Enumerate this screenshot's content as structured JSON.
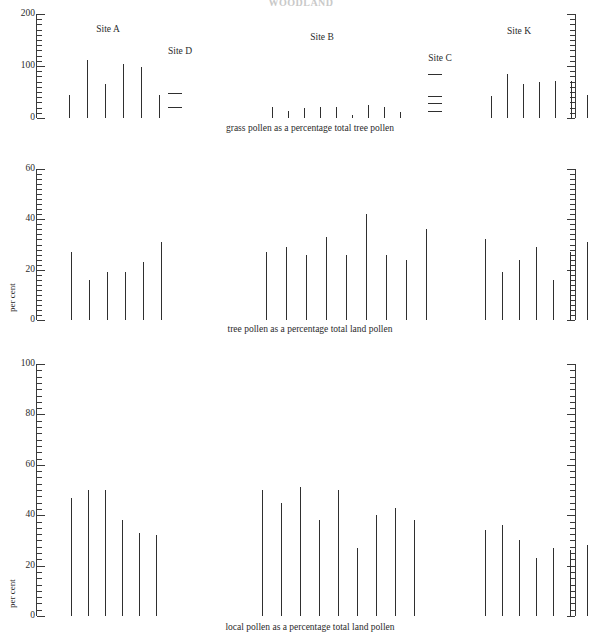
{
  "figure": {
    "top_title": "WOODLAND",
    "ylabel_panel2": "per cent",
    "ylabel_panel3": "per cent"
  },
  "site_labels": {
    "a": "Site A",
    "d": "Site D",
    "b": "Site B",
    "c": "Site C",
    "k": "Site K"
  },
  "captions": {
    "panel1": "grass pollen as a percentage total tree pollen",
    "panel2": "tree pollen as a percentage total land pollen",
    "panel3": "local pollen as a percentage total land pollen"
  },
  "chart_data": [
    {
      "type": "bar",
      "title": "grass pollen as a percentage total tree pollen",
      "xlabel": "",
      "ylabel": "",
      "ylim": [
        0,
        200
      ],
      "ticks_major": [
        0,
        100,
        200
      ],
      "tick_interval_minor": 10,
      "grid": false,
      "axes": "ruler style, mirrored left and right",
      "series": [
        {
          "name": "Site A",
          "values": [
            44,
            112,
            66,
            103,
            99,
            45
          ]
        },
        {
          "name": "Site D",
          "values": [
            7,
            3
          ]
        },
        {
          "name": "Site B",
          "values": [
            22,
            14,
            20,
            21,
            22,
            5,
            25,
            22,
            12
          ]
        },
        {
          "name": "Site C",
          "values": [
            12,
            6,
            4,
            2
          ]
        },
        {
          "name": "Site K",
          "values": [
            43,
            85,
            65,
            70,
            72,
            71,
            44
          ]
        }
      ]
    },
    {
      "type": "bar",
      "title": "tree pollen as a percentage total land pollen",
      "xlabel": "",
      "ylabel": "per cent",
      "ylim": [
        0,
        60
      ],
      "ticks_major": [
        0,
        20,
        40,
        60
      ],
      "tick_interval_minor": 2,
      "grid": false,
      "axes": "ruler style, mirrored left and right",
      "series": [
        {
          "name": "Site A",
          "values": [
            27,
            16,
            19,
            19,
            23,
            31
          ]
        },
        {
          "name": "Site B",
          "values": [
            27,
            29,
            26,
            33,
            26,
            42,
            26,
            24,
            36
          ]
        },
        {
          "name": "Site K",
          "values": [
            32,
            19,
            24,
            29,
            16,
            27,
            31
          ]
        }
      ]
    },
    {
      "type": "bar",
      "title": "local pollen as a percentage total land pollen",
      "xlabel": "",
      "ylabel": "per cent",
      "ylim": [
        0,
        100
      ],
      "ticks_major": [
        0,
        20,
        40,
        60,
        80,
        100
      ],
      "tick_interval_minor": 2.5,
      "grid": false,
      "axes": "ruler style, mirrored left and right",
      "series": [
        {
          "name": "Site A",
          "values": [
            47,
            50,
            50,
            38,
            33,
            32
          ]
        },
        {
          "name": "Site B",
          "values": [
            50,
            45,
            51,
            38,
            50,
            27,
            40,
            43,
            38
          ]
        },
        {
          "name": "Site K",
          "values": [
            34,
            36,
            30,
            23,
            27,
            26,
            28
          ]
        }
      ]
    }
  ],
  "layout": {
    "panels": [
      {
        "top": 8,
        "baseline": 118,
        "axis_top": 14,
        "axis_left_x": 36,
        "axis_right_x": 566,
        "groups": [
          {
            "key": "a",
            "label_x": 108,
            "label_y": 25,
            "start": 69,
            "gap": 18,
            "flat": false
          },
          {
            "key": "d",
            "label_x": 180,
            "label_y": 47,
            "start": 168,
            "gap": 0,
            "flat": true
          },
          {
            "key": "b",
            "label_x": 322,
            "label_y": 33,
            "start": 272,
            "gap": 16,
            "flat": false
          },
          {
            "key": "c",
            "label_x": 440,
            "label_y": 54,
            "start": 428,
            "gap": 0,
            "flat": true
          },
          {
            "key": "k",
            "label_x": 519,
            "label_y": 27,
            "start": 491,
            "gap": 16,
            "flat": false
          }
        ],
        "caption_x": 310,
        "caption_y": 124
      },
      {
        "top": 160,
        "baseline": 320,
        "axis_top": 169,
        "axis_left_x": 36,
        "axis_right_x": 566,
        "groups": [
          {
            "key": "a",
            "start": 71,
            "gap": 18,
            "flat": false
          },
          {
            "key": "b",
            "start": 266,
            "gap": 20,
            "flat": false
          },
          {
            "key": "k",
            "start": 485,
            "gap": 17,
            "flat": false
          }
        ],
        "caption_x": 310,
        "caption_y": 325
      },
      {
        "top": 355,
        "baseline": 616,
        "axis_top": 364,
        "axis_left_x": 36,
        "axis_right_x": 566,
        "groups": [
          {
            "key": "a",
            "start": 71,
            "gap": 17,
            "flat": false
          },
          {
            "key": "b",
            "start": 262,
            "gap": 19,
            "flat": false
          },
          {
            "key": "k",
            "start": 485,
            "gap": 17,
            "flat": false
          }
        ],
        "caption_x": 310,
        "caption_y": 623
      }
    ]
  }
}
